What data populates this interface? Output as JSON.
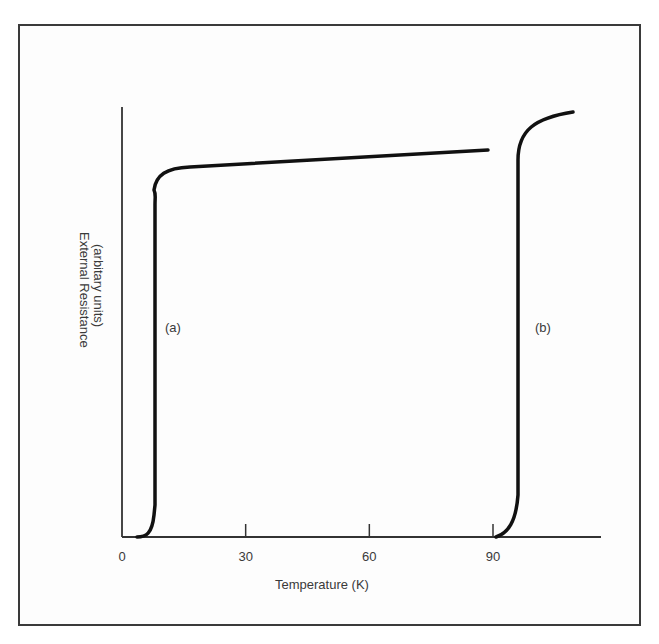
{
  "chart_data": {
    "type": "line",
    "title": "",
    "xlabel": "Temperature (K)",
    "ylabel": "External Resistance (arbitary units)",
    "ylabel_lines": [
      "External Resistance",
      "(arbitary units)"
    ],
    "xlim": [
      0,
      115
    ],
    "ylim": [
      0,
      1
    ],
    "x_ticks": [
      0,
      30,
      60,
      90
    ],
    "x_tick_labels": [
      "0",
      "30",
      "60",
      "90"
    ],
    "y_ticks": [],
    "grid": false,
    "legend": null,
    "annotations": [
      {
        "text": "(a)",
        "x": 12,
        "y": 0.53
      },
      {
        "text": "(b)",
        "x": 101,
        "y": 0.53
      }
    ],
    "series": [
      {
        "name": "(a)",
        "x": [
          4,
          6,
          8,
          8.5,
          9,
          9,
          10,
          12,
          15,
          20,
          40,
          60,
          80,
          90
        ],
        "y": [
          0,
          0.01,
          0.05,
          0.2,
          0.5,
          0.8,
          0.84,
          0.855,
          0.86,
          0.865,
          0.875,
          0.885,
          0.895,
          0.9
        ]
      },
      {
        "name": "(b)",
        "x": [
          92,
          94,
          96,
          97,
          97.5,
          98,
          99,
          101,
          104,
          108
        ],
        "y": [
          0,
          0.02,
          0.07,
          0.3,
          0.6,
          0.85,
          0.9,
          0.935,
          0.955,
          0.97
        ]
      }
    ]
  },
  "frame": {
    "border_color": "#3a3a3a",
    "line_color": "#111111",
    "text_color": "#3a3a3a"
  }
}
